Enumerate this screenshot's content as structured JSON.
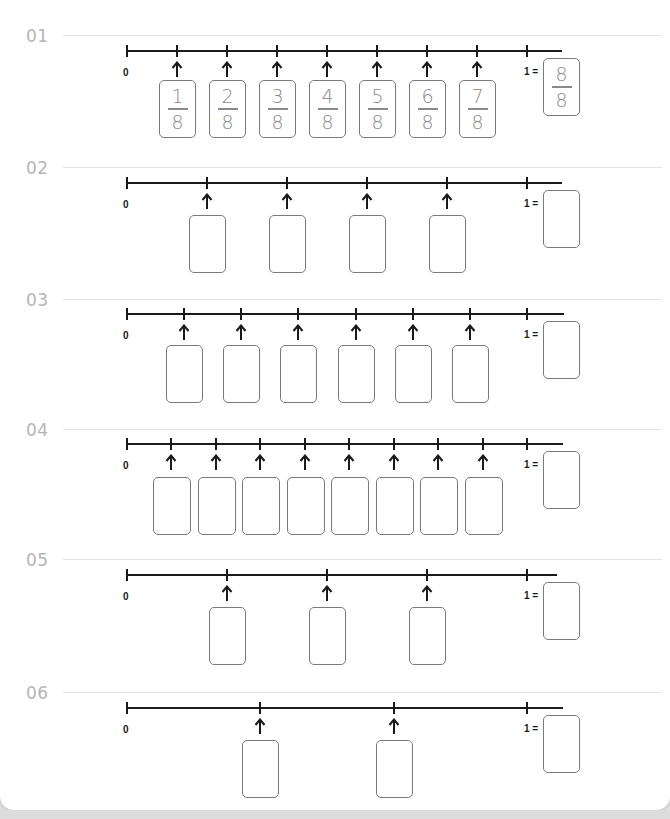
{
  "worksheet": {
    "sections": [
      {
        "number": "01",
        "zero_label": "0",
        "one_label": "1 =",
        "denominator": 8,
        "boxes": [
          {
            "num": "1",
            "den": "8"
          },
          {
            "num": "2",
            "den": "8"
          },
          {
            "num": "3",
            "den": "8"
          },
          {
            "num": "4",
            "den": "8"
          },
          {
            "num": "5",
            "den": "8"
          },
          {
            "num": "6",
            "den": "8"
          },
          {
            "num": "7",
            "den": "8"
          }
        ],
        "whole_box": {
          "num": "8",
          "den": "8"
        }
      },
      {
        "number": "02",
        "zero_label": "0",
        "one_label": "1 =",
        "denominator": 5,
        "boxes": [
          {},
          {},
          {},
          {}
        ],
        "whole_box": {}
      },
      {
        "number": "03",
        "zero_label": "0",
        "one_label": "1 =",
        "denominator": 7,
        "boxes": [
          {},
          {},
          {},
          {},
          {},
          {}
        ],
        "whole_box": {}
      },
      {
        "number": "04",
        "zero_label": "0",
        "one_label": "1 =",
        "denominator": 9,
        "boxes": [
          {},
          {},
          {},
          {},
          {},
          {},
          {},
          {}
        ],
        "whole_box": {}
      },
      {
        "number": "05",
        "zero_label": "0",
        "one_label": "1 =",
        "denominator": 4,
        "boxes": [
          {},
          {},
          {}
        ],
        "whole_box": {}
      },
      {
        "number": "06",
        "zero_label": "0",
        "one_label": "1 =",
        "denominator": 3,
        "boxes": [
          {},
          {}
        ],
        "whole_box": {}
      }
    ]
  },
  "colors": {
    "section_number": "#b5b5b5",
    "line": "#1a1a1a",
    "box_border": "#7a7a7a",
    "fraction_text": "#8a8a8a"
  }
}
